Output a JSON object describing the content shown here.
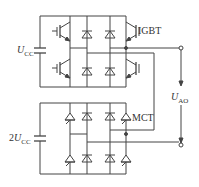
{
  "diagram": {
    "type": "circuit",
    "title": "",
    "top_bridge": {
      "supply_label_prefix": "",
      "supply_label_symbol": "U",
      "supply_label_sub": "CC",
      "device_label": "IGBT"
    },
    "bottom_bridge": {
      "supply_label_prefix": "2",
      "supply_label_symbol": "U",
      "supply_label_sub": "CC",
      "device_label": "MCT"
    },
    "output": {
      "label_symbol": "U",
      "label_sub": "AO"
    },
    "colors": {
      "line": "#444444",
      "background": "#ffffff"
    }
  }
}
